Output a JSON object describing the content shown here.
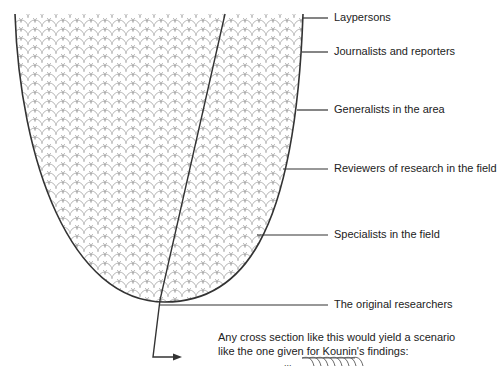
{
  "labels": [
    {
      "id": "laypersons",
      "text": "Laypersons"
    },
    {
      "id": "journalists",
      "text": "Journalists and reporters"
    },
    {
      "id": "generalists",
      "text": "Generalists in the area"
    },
    {
      "id": "reviewers",
      "text": "Reviewers of research in the field"
    },
    {
      "id": "specialists",
      "text": "Specialists in the field"
    },
    {
      "id": "original",
      "text": "The original researchers"
    }
  ],
  "note": {
    "line1": "Any cross section like this would yield a scenario",
    "line2": "like the one given for Kounin's findings:",
    "ellipsis": "..."
  },
  "colors": {
    "stroke": "#333333",
    "pattern": "#9a9a9a",
    "text": "#222222"
  }
}
